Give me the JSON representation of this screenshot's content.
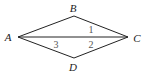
{
  "diagram": {
    "type": "quadrilateral-with-diagonal",
    "vertices": [
      {
        "id": "A",
        "label": "A",
        "x": 18,
        "y": 37,
        "label_x": 8,
        "label_y": 41
      },
      {
        "id": "B",
        "label": "B",
        "x": 74,
        "y": 16,
        "label_x": 73,
        "label_y": 12
      },
      {
        "id": "C",
        "label": "C",
        "x": 128,
        "y": 37,
        "label_x": 137,
        "label_y": 42
      },
      {
        "id": "D",
        "label": "D",
        "x": 74,
        "y": 58,
        "label_x": 73,
        "label_y": 71
      }
    ],
    "edges": [
      [
        "A",
        "B"
      ],
      [
        "B",
        "C"
      ],
      [
        "C",
        "D"
      ],
      [
        "D",
        "A"
      ],
      [
        "A",
        "C"
      ]
    ],
    "angle_labels": [
      {
        "label": "1",
        "x": 91,
        "y": 33
      },
      {
        "label": "3",
        "x": 56,
        "y": 48
      },
      {
        "label": "2",
        "x": 91,
        "y": 48
      }
    ],
    "colors": {
      "stroke": "#222222",
      "vertex_text": "#222222",
      "angle_text": "#555555"
    }
  }
}
